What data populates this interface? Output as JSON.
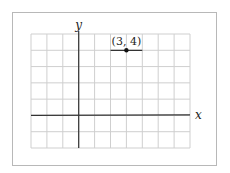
{
  "diagram": {
    "type": "coordinate-grid",
    "x_axis_label": "x",
    "y_axis_label": "y",
    "grid": {
      "columns": 10,
      "rows": 7,
      "x_range": [
        -3,
        7
      ],
      "y_range": [
        -2,
        5
      ],
      "origin_column": 3,
      "origin_row_from_top": 5
    },
    "point": {
      "x": 3,
      "y": 4,
      "label": "(3, 4)"
    },
    "segment": {
      "from": [
        2,
        4
      ],
      "to": [
        4,
        4
      ]
    },
    "colors": {
      "grid": "#cfcfcf",
      "axis": "#333333",
      "point": "#111111",
      "frame": "#b8b8b8"
    }
  }
}
